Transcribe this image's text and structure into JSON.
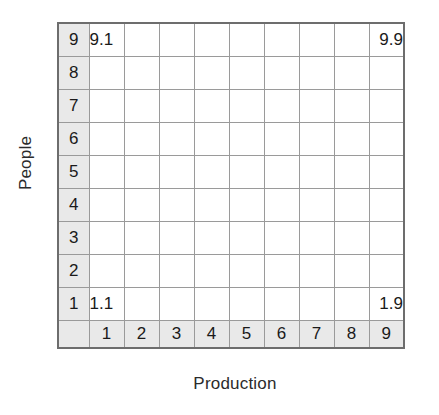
{
  "axes": {
    "y_title": "People",
    "x_title": "Production"
  },
  "chart_data": {
    "type": "heatmap",
    "title": "",
    "subtitle": "",
    "xlabel": "Production",
    "ylabel": "People",
    "xlim": [
      1,
      9
    ],
    "ylim": [
      1,
      9
    ],
    "grid": true,
    "legend": null,
    "x_tick_labels": [
      "1",
      "2",
      "3",
      "4",
      "5",
      "6",
      "7",
      "8",
      "9"
    ],
    "y_tick_labels": [
      "9",
      "8",
      "7",
      "6",
      "5",
      "4",
      "3",
      "2",
      "1"
    ],
    "annotations": [
      {
        "label": "9.1",
        "x": 1,
        "y": 9,
        "position": "top-left"
      },
      {
        "label": "9.9",
        "x": 9,
        "y": 9,
        "position": "top-right"
      },
      {
        "label": "1.1",
        "x": 1,
        "y": 1,
        "position": "bottom-left"
      },
      {
        "label": "1.9",
        "x": 9,
        "y": 1,
        "position": "bottom-right"
      }
    ],
    "cells": [
      [
        "9.1",
        "",
        "",
        "",
        "",
        "",
        "",
        "",
        "9.9"
      ],
      [
        "",
        "",
        "",
        "",
        "",
        "",
        "",
        "",
        ""
      ],
      [
        "",
        "",
        "",
        "",
        "",
        "",
        "",
        "",
        ""
      ],
      [
        "",
        "",
        "",
        "",
        "",
        "",
        "",
        "",
        ""
      ],
      [
        "",
        "",
        "",
        "",
        "",
        "",
        "",
        "",
        ""
      ],
      [
        "",
        "",
        "",
        "",
        "",
        "",
        "",
        "",
        ""
      ],
      [
        "",
        "",
        "",
        "",
        "",
        "",
        "",
        "",
        ""
      ],
      [
        "",
        "",
        "",
        "",
        "",
        "",
        "",
        "",
        ""
      ],
      [
        "1.1",
        "",
        "",
        "",
        "",
        "",
        "",
        "",
        "1.9"
      ]
    ]
  },
  "colors": {
    "header_fill": "#e9e9e9",
    "cell_fill": "#ffffff",
    "gridline": "#9a9a9a",
    "outer_border": "#6d6d6d",
    "text": "#1a1a1a"
  }
}
